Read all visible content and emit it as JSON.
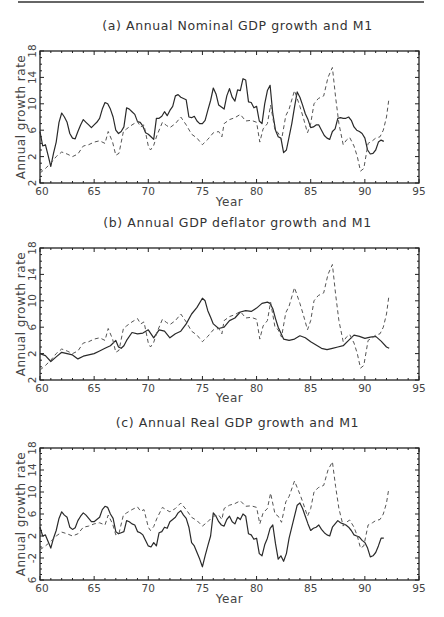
{
  "chart_data": [
    {
      "type": "line",
      "title": "(a) Annual Nominal GDP growth and M1",
      "xlabel": "Year",
      "ylabel": "Annual growth rate",
      "xlim": [
        60,
        95
      ],
      "ylim": [
        -2,
        18
      ],
      "xticks": [
        60,
        65,
        70,
        75,
        80,
        85,
        90,
        95
      ],
      "yticks": [
        -2,
        2,
        6,
        10,
        14,
        18
      ],
      "ytick_labels": [
        "2",
        "2",
        "6",
        "10",
        "14",
        "18"
      ],
      "grid": false,
      "legend": "none",
      "series": [
        {
          "name": "Nominal GDP growth",
          "style": "solid",
          "x": [
            60.0,
            60.25,
            60.5,
            60.75,
            61.0,
            61.25,
            61.5,
            61.75,
            62.0,
            62.25,
            62.5,
            62.75,
            63.0,
            63.25,
            63.5,
            63.75,
            64.0,
            64.25,
            64.5,
            64.75,
            65.0,
            65.25,
            65.5,
            65.75,
            66.0,
            66.25,
            66.5,
            66.75,
            67.0,
            67.25,
            67.5,
            67.75,
            68.0,
            68.25,
            68.5,
            68.75,
            69.0,
            69.25,
            69.5,
            69.75,
            70.0,
            70.25,
            70.5,
            70.75,
            71.0,
            71.25,
            71.5,
            71.75,
            72.0,
            72.25,
            72.5,
            72.75,
            73.0,
            73.25,
            73.5,
            73.75,
            74.0,
            74.25,
            74.5,
            74.75,
            75.0,
            75.25,
            75.5,
            75.75,
            76.0,
            76.25,
            76.5,
            76.75,
            77.0,
            77.25,
            77.5,
            77.75,
            78.0,
            78.25,
            78.5,
            78.75,
            79.0,
            79.25,
            79.5,
            79.75,
            80.0,
            80.25,
            80.5,
            80.75,
            81.0,
            81.25,
            81.5,
            81.75,
            82.0,
            82.25,
            82.5,
            82.75,
            83.0,
            83.25,
            83.5,
            83.75,
            84.0,
            84.25,
            84.5,
            84.75,
            85.0,
            85.25,
            85.5,
            85.75,
            86.0,
            86.25,
            86.5,
            86.75,
            87.0,
            87.25,
            87.5,
            87.75,
            88.0,
            88.25,
            88.5,
            88.75,
            89.0,
            89.25,
            89.5,
            89.75,
            90.0,
            90.25,
            90.5,
            90.75,
            91.0,
            91.25,
            91.5,
            91.75,
            92.0,
            92.25
          ],
          "values": [
            5.8,
            3.6,
            3.8,
            2.2,
            0.5,
            2.5,
            4.2,
            7.2,
            8.6,
            8.0,
            7.2,
            5.5,
            4.8,
            4.7,
            5.8,
            6.8,
            7.6,
            7.2,
            6.8,
            6.4,
            6.8,
            7.2,
            7.8,
            9.2,
            10.2,
            10.0,
            9.2,
            8.0,
            6.0,
            5.5,
            5.8,
            6.5,
            9.4,
            9.2,
            8.8,
            8.4,
            7.3,
            7.2,
            6.6,
            5.6,
            5.4,
            5.0,
            4.6,
            7.8,
            7.8,
            8.1,
            8.8,
            8.2,
            9.0,
            9.6,
            11.2,
            11.4,
            11.0,
            10.8,
            10.6,
            8.0,
            7.9,
            8.1,
            7.4,
            7.0,
            7.0,
            7.5,
            9.0,
            10.5,
            12.4,
            11.5,
            9.8,
            9.5,
            9.2,
            11.2,
            12.3,
            11.0,
            10.4,
            12.1,
            12.0,
            13.8,
            13.6,
            10.3,
            10.2,
            9.4,
            9.6,
            7.4,
            7.0,
            10.0,
            12.0,
            12.8,
            8.5,
            6.0,
            5.0,
            4.8,
            2.6,
            3.0,
            5.0,
            7.0,
            9.5,
            11.8,
            11.0,
            9.8,
            8.5,
            7.6,
            6.4,
            6.5,
            6.8,
            6.8,
            6.0,
            5.2,
            4.8,
            4.6,
            5.8,
            6.2,
            7.8,
            7.9,
            7.8,
            7.8,
            8.0,
            7.5,
            6.5,
            6.0,
            5.8,
            5.5,
            4.8,
            3.0,
            2.4,
            2.5,
            3.0,
            4.2,
            4.5,
            4.3
          ]
        },
        {
          "name": "M1 growth",
          "style": "dashed",
          "x": [
            60.0,
            60.5,
            61.0,
            61.5,
            62.0,
            62.5,
            63.0,
            63.5,
            64.0,
            64.5,
            65.0,
            65.5,
            66.0,
            66.3,
            66.7,
            67.0,
            67.3,
            67.7,
            68.0,
            68.5,
            69.0,
            69.3,
            69.6,
            70.0,
            70.2,
            70.5,
            70.8,
            71.3,
            71.7,
            72.0,
            72.5,
            73.0,
            73.5,
            74.0,
            74.5,
            75.0,
            75.5,
            76.0,
            76.5,
            76.8,
            77.0,
            77.5,
            78.0,
            78.5,
            79.0,
            79.5,
            80.0,
            80.3,
            80.6,
            81.0,
            81.3,
            81.7,
            82.0,
            82.3,
            82.7,
            83.0,
            83.5,
            84.0,
            84.3,
            84.7,
            85.0,
            85.3,
            85.7,
            86.2,
            86.6,
            87.0,
            87.3,
            87.6,
            88.0,
            88.3,
            88.6,
            89.0,
            89.3,
            89.6,
            89.9,
            90.3,
            90.7,
            91.0,
            91.4,
            91.7,
            92.0,
            92.2
          ],
          "values": [
            -0.5,
            0.2,
            1.0,
            2.0,
            2.7,
            2.4,
            2.0,
            2.4,
            3.6,
            3.8,
            4.2,
            4.4,
            4.0,
            5.8,
            4.2,
            2.2,
            2.5,
            5.8,
            6.2,
            6.8,
            7.3,
            6.5,
            6.8,
            3.6,
            3.0,
            3.7,
            5.2,
            7.2,
            6.7,
            6.4,
            7.0,
            8.0,
            6.8,
            5.4,
            4.8,
            3.8,
            4.6,
            5.6,
            5.8,
            5.0,
            7.0,
            7.6,
            7.9,
            8.4,
            7.4,
            7.5,
            7.2,
            4.2,
            6.2,
            7.0,
            9.8,
            6.0,
            5.6,
            4.5,
            8.2,
            9.2,
            12.0,
            9.6,
            8.0,
            5.6,
            7.0,
            10.0,
            10.8,
            11.2,
            14.0,
            15.5,
            11.0,
            7.0,
            3.8,
            4.5,
            4.9,
            3.6,
            2.0,
            -0.2,
            0.2,
            4.0,
            4.4,
            4.8,
            5.0,
            6.0,
            8.0,
            10.5
          ]
        }
      ]
    },
    {
      "type": "line",
      "title": "(b) Annual GDP deflator growth and M1",
      "xlabel": "Year",
      "ylabel": "Annual growth rate",
      "xlim": [
        60,
        95
      ],
      "ylim": [
        -2,
        18
      ],
      "xticks": [
        60,
        65,
        70,
        75,
        80,
        85,
        90,
        95
      ],
      "yticks": [
        -2,
        2,
        6,
        10,
        14,
        18
      ],
      "ytick_labels": [
        "2",
        "2",
        "6",
        "10",
        "14",
        "18"
      ],
      "grid": false,
      "legend": "none",
      "series": [
        {
          "name": "GDP deflator growth",
          "style": "solid",
          "x": [
            60.0,
            60.5,
            61.0,
            61.5,
            62.0,
            62.5,
            63.0,
            63.5,
            64.0,
            64.5,
            65.0,
            65.5,
            66.0,
            66.5,
            67.0,
            67.25,
            67.5,
            67.75,
            68.0,
            68.5,
            69.0,
            69.5,
            70.0,
            70.5,
            70.75,
            71.0,
            71.5,
            72.0,
            72.5,
            73.0,
            73.5,
            74.0,
            74.5,
            75.0,
            75.25,
            75.5,
            75.75,
            76.0,
            76.5,
            77.0,
            77.5,
            78.0,
            78.5,
            79.0,
            79.5,
            80.0,
            80.5,
            81.0,
            81.25,
            81.5,
            81.75,
            82.0,
            82.5,
            83.0,
            83.5,
            84.0,
            84.5,
            85.0,
            85.5,
            86.0,
            86.5,
            87.0,
            87.5,
            88.0,
            88.5,
            89.0,
            89.5,
            90.0,
            90.5,
            91.0,
            91.5,
            92.0,
            92.25
          ],
          "values": [
            2.0,
            1.7,
            0.8,
            1.5,
            2.2,
            2.0,
            1.8,
            1.2,
            1.6,
            1.8,
            2.0,
            2.4,
            2.8,
            3.2,
            4.0,
            3.0,
            2.8,
            3.2,
            4.0,
            5.2,
            5.0,
            5.1,
            5.6,
            4.4,
            5.0,
            5.6,
            5.4,
            4.4,
            5.0,
            5.4,
            6.5,
            8.0,
            9.0,
            10.4,
            10.0,
            8.5,
            7.5,
            6.5,
            5.8,
            6.0,
            7.0,
            7.4,
            8.3,
            8.5,
            8.4,
            8.9,
            9.6,
            9.8,
            9.6,
            8.8,
            7.3,
            6.0,
            4.2,
            4.0,
            4.2,
            4.7,
            4.4,
            3.8,
            3.3,
            2.8,
            2.6,
            2.8,
            3.0,
            3.2,
            4.0,
            4.8,
            4.6,
            4.3,
            4.5,
            4.6,
            3.9,
            3.0,
            2.8
          ]
        },
        {
          "name": "M1 growth",
          "style": "dashed",
          "ref": "same as panel (a) M1 series"
        }
      ]
    },
    {
      "type": "line",
      "title": "(c) Annual Real GDP growth and M1",
      "xlabel": "Year",
      "ylabel": "Annual growth rate",
      "xlim": [
        60,
        95
      ],
      "ylim": [
        -6,
        18
      ],
      "xticks": [
        60,
        65,
        70,
        75,
        80,
        85,
        90,
        95
      ],
      "yticks": [
        -6,
        -2,
        2,
        6,
        10,
        14,
        18
      ],
      "ytick_labels": [
        "6",
        "-2",
        "2",
        "6",
        "10",
        "14",
        "18"
      ],
      "grid": false,
      "legend": "none",
      "series": [
        {
          "name": "Real GDP growth",
          "style": "solid",
          "x": [
            60.0,
            60.25,
            60.5,
            60.75,
            61.0,
            61.25,
            61.5,
            61.75,
            62.0,
            62.25,
            62.5,
            62.75,
            63.0,
            63.25,
            63.5,
            63.75,
            64.0,
            64.25,
            64.5,
            64.75,
            65.0,
            65.25,
            65.5,
            65.75,
            66.0,
            66.25,
            66.5,
            66.75,
            67.0,
            67.25,
            67.5,
            67.75,
            68.0,
            68.25,
            68.5,
            68.75,
            69.0,
            69.25,
            69.5,
            69.75,
            70.0,
            70.25,
            70.5,
            70.75,
            71.0,
            71.25,
            71.5,
            71.75,
            72.0,
            72.25,
            72.5,
            72.75,
            73.0,
            73.25,
            73.5,
            73.75,
            74.0,
            74.25,
            74.5,
            74.75,
            75.0,
            75.25,
            75.5,
            75.75,
            76.0,
            76.25,
            76.5,
            76.75,
            77.0,
            77.25,
            77.5,
            77.75,
            78.0,
            78.25,
            78.5,
            78.75,
            79.0,
            79.25,
            79.5,
            79.75,
            80.0,
            80.25,
            80.5,
            80.75,
            81.0,
            81.25,
            81.5,
            81.75,
            82.0,
            82.25,
            82.5,
            82.75,
            83.0,
            83.25,
            83.5,
            83.75,
            84.0,
            84.25,
            84.5,
            84.75,
            85.0,
            85.25,
            85.5,
            85.75,
            86.0,
            86.25,
            86.5,
            86.75,
            87.0,
            87.25,
            87.5,
            87.75,
            88.0,
            88.25,
            88.5,
            88.75,
            89.0,
            89.25,
            89.5,
            89.75,
            90.0,
            90.25,
            90.5,
            90.75,
            91.0,
            91.25,
            91.5,
            91.75,
            92.0,
            92.25
          ],
          "values": [
            3.6,
            2.0,
            2.2,
            1.0,
            -0.2,
            1.6,
            3.0,
            5.2,
            6.4,
            5.8,
            5.4,
            3.6,
            3.2,
            3.5,
            4.8,
            5.6,
            6.2,
            5.8,
            5.2,
            4.6,
            4.6,
            5.0,
            5.4,
            6.8,
            7.4,
            7.2,
            6.0,
            5.2,
            2.8,
            2.4,
            2.6,
            2.8,
            4.8,
            4.6,
            4.2,
            4.0,
            2.8,
            2.6,
            2.2,
            1.2,
            0.2,
            0.0,
            0.8,
            0.2,
            2.6,
            2.8,
            3.6,
            3.4,
            4.6,
            5.0,
            5.4,
            6.2,
            6.6,
            5.8,
            5.2,
            3.6,
            0.8,
            0.2,
            -1.0,
            -2.2,
            -3.6,
            -1.6,
            0.2,
            2.0,
            6.2,
            5.6,
            4.6,
            4.0,
            3.8,
            5.0,
            5.6,
            4.6,
            4.2,
            5.4,
            5.0,
            6.0,
            5.6,
            2.4,
            2.2,
            1.4,
            1.6,
            -1.2,
            -1.6,
            0.4,
            1.6,
            3.4,
            4.0,
            0.6,
            -2.2,
            -1.6,
            -2.6,
            -1.2,
            1.6,
            3.6,
            5.6,
            7.6,
            8.0,
            7.0,
            5.6,
            4.2,
            3.0,
            3.4,
            3.6,
            4.0,
            3.2,
            2.6,
            2.2,
            2.0,
            3.6,
            4.2,
            4.8,
            4.4,
            4.2,
            4.0,
            3.6,
            3.0,
            2.2,
            2.0,
            1.8,
            1.2,
            0.8,
            -0.2,
            -1.8,
            -1.6,
            -1.0,
            0.2,
            1.6,
            1.6
          ]
        },
        {
          "name": "M1 growth",
          "style": "dashed",
          "ref": "same as panel (a) M1 series"
        }
      ]
    }
  ]
}
